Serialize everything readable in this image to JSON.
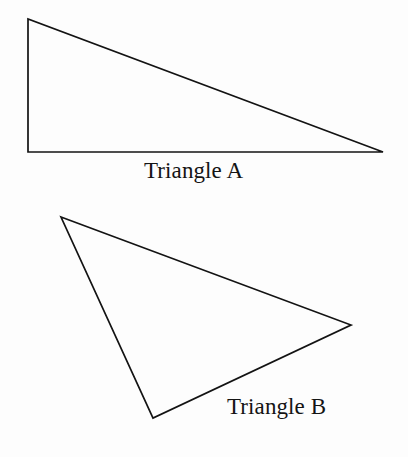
{
  "figure": {
    "background_color": "#fdfdfd",
    "stroke_color": "#131313",
    "stroke_width": 1.7,
    "width": 408,
    "height": 457,
    "shapes": [
      {
        "id": "triangle-a",
        "label": "Triangle A",
        "kind": "triangle",
        "description": "right triangle, right angle at lower-left",
        "points": "28,19 28,152 383,152",
        "vertices": [
          {
            "name": "top-left",
            "x": 28,
            "y": 19
          },
          {
            "name": "bottom-left",
            "x": 28,
            "y": 152
          },
          {
            "name": "bottom-right",
            "x": 383,
            "y": 152
          }
        ]
      },
      {
        "id": "triangle-b",
        "label": "Triangle B",
        "kind": "triangle",
        "description": "scalene triangle tilted, apex upper-left",
        "points": "61,217 351,325 153,418",
        "vertices": [
          {
            "name": "top-left",
            "x": 61,
            "y": 217
          },
          {
            "name": "right",
            "x": 351,
            "y": 325
          },
          {
            "name": "bottom",
            "x": 153,
            "y": 418
          }
        ]
      }
    ]
  }
}
